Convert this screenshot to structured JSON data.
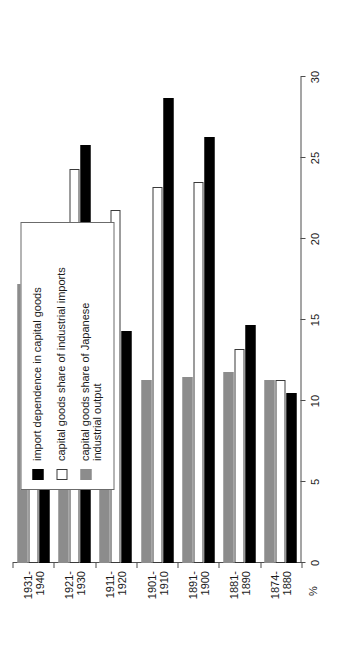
{
  "chart_data": {
    "type": "bar",
    "orientation": "horizontal",
    "title": "",
    "xlabel": "%",
    "ylabel": "",
    "xlim": [
      0,
      30
    ],
    "xticks": [
      "0",
      "5",
      "10",
      "15",
      "20",
      "25",
      "30"
    ],
    "grid": false,
    "legend_position": "upper-right",
    "categories": [
      "1874-\n1880",
      "1881-\n1890",
      "1891-\n1900",
      "1901-\n1910",
      "1911-\n1920",
      "1921-\n1930",
      "1931-\n1940"
    ],
    "series": [
      {
        "name": "import dependence in capital goods",
        "color": "#000000",
        "values": [
          10.5,
          14.7,
          26.3,
          28.7,
          14.3,
          25.8,
          8.0
        ]
      },
      {
        "name": "capital goods share of  industrial imports",
        "color": "#ffffff",
        "values": [
          11.3,
          13.2,
          23.5,
          23.2,
          21.8,
          24.3,
          17.8
        ]
      },
      {
        "name": "capital goods  share of  Japanese\nindustrial output",
        "color": "#8c8c8c",
        "values": [
          11.3,
          11.8,
          11.5,
          11.3,
          17.2,
          17.0,
          17.2
        ]
      }
    ]
  },
  "legend": {
    "entries": [
      "import dependence in capital goods",
      "capital goods share of  industrial imports",
      "capital goods  share of  Japanese\nindustrial output"
    ]
  },
  "axis": {
    "unit_label": "%"
  }
}
